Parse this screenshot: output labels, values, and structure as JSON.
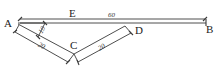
{
  "diagram": {
    "type": "geometry-dimension-figure",
    "points": {
      "A": "A",
      "B": "B",
      "C": "C",
      "D": "D",
      "E": "E"
    },
    "dimensions": {
      "AB": "60",
      "A_short": "10",
      "AC": "20",
      "CD": "20"
    },
    "colors": {
      "line": "#3a3a3a",
      "text": "#222222",
      "background": "#ffffff"
    }
  }
}
